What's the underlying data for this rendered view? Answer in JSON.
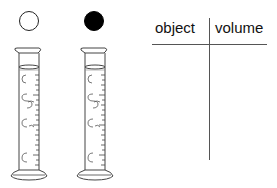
{
  "objects": [
    {
      "name": "white-ball",
      "fill": "#ffffff",
      "stroke": "#222222"
    },
    {
      "name": "black-ball",
      "fill": "#000000",
      "stroke": "#000000"
    }
  ],
  "cylinders": [
    {
      "label": "graduated-cylinder-1"
    },
    {
      "label": "graduated-cylinder-2"
    }
  ],
  "table": {
    "headers": [
      "object",
      "volume"
    ],
    "rows": []
  }
}
